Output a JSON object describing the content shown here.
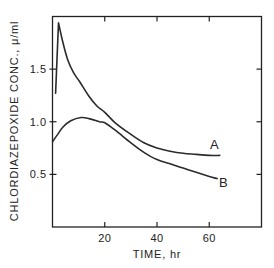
{
  "chart_data": {
    "type": "line",
    "title": "",
    "xlabel": "TIME, hr",
    "ylabel": "CHLORDIAZEPOXIDE CONC., μ/ml",
    "xlim": [
      0,
      80
    ],
    "ylim": [
      0,
      2.0
    ],
    "xticks": [
      20,
      40,
      60
    ],
    "xtick_labels": [
      "20",
      "40",
      "60"
    ],
    "yticks": [
      0.5,
      1.0,
      1.5
    ],
    "ytick_labels": [
      "0.5",
      "1.0",
      "1.5"
    ],
    "grid": false,
    "legend": "inline labels at line ends",
    "series": [
      {
        "name": "A",
        "x": [
          1.2,
          2.3,
          4,
          5.8,
          8,
          10.4,
          14,
          17,
          20,
          24,
          30,
          35,
          40,
          45,
          50,
          55,
          60,
          64
        ],
        "y": [
          1.27,
          1.94,
          1.75,
          1.59,
          1.47,
          1.38,
          1.24,
          1.15,
          1.09,
          0.99,
          0.88,
          0.8,
          0.75,
          0.72,
          0.7,
          0.69,
          0.68,
          0.68
        ]
      },
      {
        "name": "B",
        "x": [
          0,
          2,
          4,
          7,
          11,
          14,
          18,
          20,
          24,
          30,
          35,
          40,
          45,
          50,
          55,
          60,
          63
        ],
        "y": [
          0.81,
          0.88,
          0.95,
          1.01,
          1.04,
          1.03,
          1.0,
          0.99,
          0.92,
          0.8,
          0.71,
          0.64,
          0.6,
          0.56,
          0.52,
          0.48,
          0.46
        ]
      }
    ]
  }
}
